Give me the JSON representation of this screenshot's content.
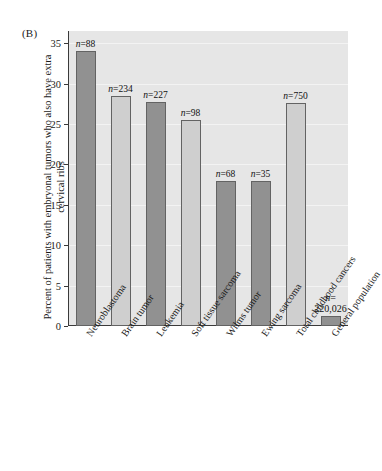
{
  "figure": {
    "panel_label": "(B)"
  },
  "chart_data": {
    "type": "bar",
    "title": "",
    "subtitle": "",
    "xlabel": "",
    "ylabel": "Percent of patients with embryonal tumors who also have extra cervical ribs",
    "ylim": [
      0,
      36.5
    ],
    "yticks": [
      0,
      5,
      10,
      15,
      20,
      25,
      30,
      35
    ],
    "ytick_labels": [
      "0",
      "5",
      "10",
      "15",
      "20",
      "25",
      "30",
      "35"
    ],
    "grid": true,
    "legend": "none",
    "categories": [
      "Neuroblastoma",
      "Brain tumor",
      "Leukemia",
      "Soft tissue sarcoma",
      "Wilms tumor",
      "Ewing sarcoma",
      "Total childhood cancers",
      "General population"
    ],
    "values": [
      34.0,
      28.5,
      27.7,
      25.5,
      18.0,
      18.0,
      27.6,
      1.2
    ],
    "annotations": [
      "n=88",
      "n=234",
      "n=227",
      "n=98",
      "n=68",
      "n=35",
      "n=750",
      "n= 220,026"
    ],
    "n_values": [
      "88",
      "234",
      "227",
      "98",
      "68",
      "35",
      "750",
      "220,026"
    ],
    "bar_shades": [
      "dark",
      "light",
      "dark",
      "light",
      "dark",
      "dark",
      "light",
      "dark"
    ],
    "colors": {
      "plot_background": "#e6e6e6",
      "gridline": "#f3f3f3",
      "bar_dark": "#919191",
      "bar_light": "#cfcfcf",
      "bar_outline": "#636363",
      "axis": "#3a3a3a",
      "text": "#1a1a1a",
      "page_background": "#ffffff"
    }
  }
}
